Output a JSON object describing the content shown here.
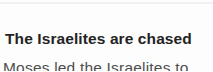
{
  "story": {
    "heading": "The Israelites are chased",
    "paragraph": {
      "line1": "Moses led the Israelites to",
      "line2_partial": "the water of the sea, but"
    }
  },
  "colors": {
    "background": "#fdfdfd",
    "heading_text": "#232323",
    "body_text": "#4e4e4e",
    "top_streak": "#ececec"
  }
}
